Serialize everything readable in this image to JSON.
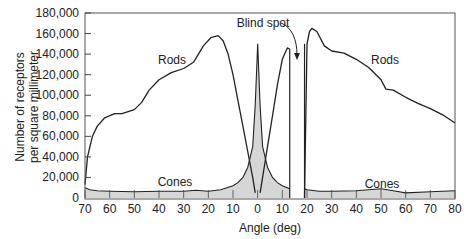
{
  "chart_data": {
    "type": "area",
    "title": "",
    "xlabel": "Angle (deg)",
    "ylabel_line1": "Number of receptors",
    "ylabel_line2": "per square millimeter",
    "xlim": [
      -70,
      80
    ],
    "ylim": [
      0,
      180000
    ],
    "grid": false,
    "x_ticks": [
      -70,
      -60,
      -50,
      -40,
      -30,
      -20,
      -10,
      0,
      10,
      20,
      30,
      40,
      50,
      60,
      70,
      80
    ],
    "x_tick_labels": [
      "70",
      "60",
      "50",
      "40",
      "30",
      "20",
      "10",
      "0",
      "10",
      "20",
      "30",
      "40",
      "50",
      "60",
      "70",
      "80"
    ],
    "y_ticks": [
      0,
      20000,
      40000,
      60000,
      80000,
      100000,
      120000,
      140000,
      160000,
      180000
    ],
    "y_tick_labels": [
      "0",
      "20,000",
      "40,000",
      "60,000",
      "80,000",
      "100,000",
      "120,000",
      "140,000",
      "160,000",
      "180,000"
    ],
    "blind_spot": {
      "from_deg": 13,
      "to_deg": 19,
      "label": "Blind spot"
    },
    "series": [
      {
        "name": "Rods",
        "style": "line",
        "segments": [
          {
            "x": [
              -70,
              -69,
              -67,
              -65,
              -62,
              -58,
              -55,
              -50,
              -47,
              -44,
              -40,
              -35,
              -30,
              -26,
              -22,
              -19,
              -16,
              -14,
              -12,
              -10,
              -8,
              -6,
              -4,
              -2,
              -1
            ],
            "y": [
              13000,
              40000,
              60000,
              70000,
              78000,
              82000,
              82000,
              86000,
              93000,
              105000,
              115000,
              122000,
              126000,
              132000,
              148000,
              156000,
              158000,
              153000,
              140000,
              120000,
              95000,
              70000,
              45000,
              20000,
              5000
            ]
          },
          {
            "x": [
              1,
              2,
              4,
              6,
              8,
              10,
              12,
              13
            ],
            "y": [
              5000,
              20000,
              50000,
              80000,
              110000,
              135000,
              146000,
              145000
            ]
          },
          {
            "x": [
              19,
              20,
              21,
              22,
              24,
              27,
              30,
              35,
              40,
              45,
              50,
              52,
              55,
              60,
              65,
              70,
              75,
              80
            ],
            "y": [
              0,
              150000,
              162000,
              165000,
              162000,
              148000,
              143000,
              141000,
              135000,
              127000,
              115000,
              106000,
              105000,
              98000,
              92000,
              87000,
              81000,
              73000
            ]
          }
        ]
      },
      {
        "name": "Cones",
        "style": "shaded",
        "x": [
          -70,
          -68,
          -65,
          -60,
          -50,
          -40,
          -30,
          -25,
          -20,
          -15,
          -10,
          -8,
          -6,
          -4,
          -2,
          -1,
          0,
          1,
          2,
          4,
          6,
          8,
          10,
          13,
          19,
          20,
          25,
          30,
          40,
          50,
          55,
          60,
          70,
          80
        ],
        "y": [
          10000,
          8000,
          7000,
          6500,
          6000,
          6500,
          6500,
          7500,
          6500,
          8000,
          12000,
          15000,
          20000,
          30000,
          50000,
          90000,
          150000,
          90000,
          50000,
          30000,
          20000,
          15000,
          12000,
          9000,
          9000,
          8000,
          6500,
          6500,
          7000,
          9000,
          7000,
          5000,
          6000,
          7000
        ]
      }
    ],
    "annotations": [
      {
        "text": "Rods",
        "x": -30,
        "y": 123000
      },
      {
        "text": "Rods",
        "x": 58,
        "y": 123000
      },
      {
        "text": "Cones",
        "x": -30,
        "y": 10000
      },
      {
        "text": "Cones",
        "x": 50,
        "y": 10000
      },
      {
        "text": "Blind spot",
        "x": 10,
        "y": 168000
      }
    ]
  },
  "labels": {
    "xlabel": "Angle (deg)",
    "ylabel_line1": "Number of receptors",
    "ylabel_line2": "per square millimeter",
    "rods_left": "Rods",
    "rods_right": "Rods",
    "cones_left": "Cones",
    "cones_right": "Cones",
    "blind_spot": "Blind spot"
  },
  "colors": {
    "line": "#222222",
    "fill": "#d6d6d6",
    "frame": "#555555"
  }
}
